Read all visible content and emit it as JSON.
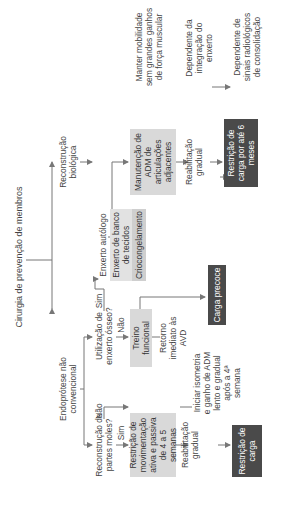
{
  "title": "Cirurgia de prevenção de membros",
  "branches": {
    "left": "Endoprótese não convencional",
    "right": "Reconstrução biológica"
  },
  "questions": {
    "soft_tissue": "Reconstrução de partes moles?",
    "bone_graft": "Utilização de enxerto ósseo?"
  },
  "labels": {
    "sim1": "Sim",
    "nao1": "Não",
    "sim2": "Sim",
    "nao2": "Não"
  },
  "boxes": {
    "restricao_mov": "Restrição de movimentação ativa e passiva de 4 a 5 semanas",
    "treino": "Treino funcional",
    "enxerto_autologo": "Enxerto autólogo",
    "enxerto_banco": "Enxerto de banco de tecidos",
    "crio": "Criocongelamento",
    "manutencao": "Manutenção de ADM de articulações adjacentes",
    "carga_precoce": "Carga precoce",
    "restricao_carga": "Restrição de carga",
    "restricao_6m": "Restrição de carga por até 6 meses"
  },
  "notes": {
    "reab1": "Reabilitação gradual",
    "isometria": "Iniciar isometria e ganho de ADM lento e gradual após a 4ª semana",
    "retorno": "Retorno imediato às AVD",
    "reab2": "Reabilitação gradual",
    "manter": "Manter mobilidade sem grandes ganhos de força muscular",
    "dep_integ": "Dependente da integração do enxerto",
    "dep_sinais": "Dependente de sinais radiológicos de consolidação"
  },
  "colors": {
    "light_box": "#d9d9d9",
    "dark_box": "#4a4a4a",
    "line": "#777777"
  }
}
